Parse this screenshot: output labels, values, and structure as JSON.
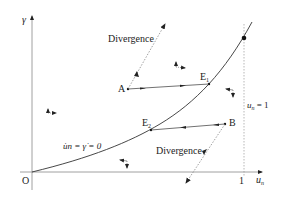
{
  "axes": {
    "y_label": "γ",
    "x_label_main": "u",
    "x_label_sub": "n",
    "origin_label": "O",
    "x_tick_label": "1"
  },
  "curve": {
    "label_u": "u",
    "label_hat": "˙",
    "label_sub": "n",
    "label_rest": " = γ̇ = 0",
    "label_full": "u̇n = γ̇ = 0"
  },
  "vertical_line": {
    "label_main": "u",
    "label_sub": "n",
    "label_rest": " = 1"
  },
  "points": {
    "A": {
      "label": "A"
    },
    "B": {
      "label": "B"
    },
    "E1": {
      "label": "E",
      "sub": "1"
    },
    "E2": {
      "label": "E",
      "sub": "2"
    }
  },
  "annotations": {
    "divergence_top": "Divergence",
    "divergence_bottom": "Divergence"
  },
  "colors": {
    "line": "#333333",
    "dashed": "#888888",
    "axis": "#777777",
    "text": "#222222"
  }
}
